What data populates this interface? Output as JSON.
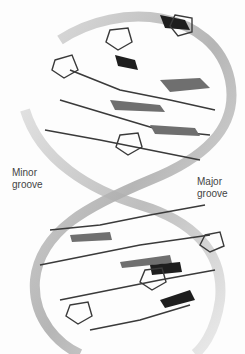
{
  "figure": {
    "labels": {
      "minor_groove_line1": "Minor",
      "minor_groove_line2": "groove",
      "major_groove_line1": "Major",
      "major_groove_line2": "groove"
    },
    "colors": {
      "backbone_ribbon": "#bdbdbd",
      "stick_bonds": "#3a3a3a",
      "base_plates": "#6f6f6f",
      "dark_bases": "#1e1e1e",
      "label_text": "#444444",
      "background": "#fdfdfd"
    }
  }
}
